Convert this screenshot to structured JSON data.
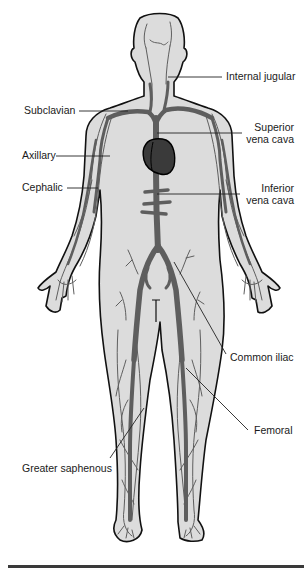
{
  "figure": {
    "colors": {
      "skin_fill": "#dcdcdc",
      "outline": "#111111",
      "vein": "#5e5e5e",
      "heart": "#3a3a3a",
      "leader_line": "#222222",
      "background": "#ffffff"
    }
  },
  "labels": {
    "internal_jugular": "Internal jugular",
    "subclavian": "Subclavian",
    "superior_vena_cava_line1": "Superior",
    "superior_vena_cava_line2": "vena cava",
    "axillary": "Axillary",
    "cephalic": "Cephalic",
    "inferior_vena_cava_line1": "Inferior",
    "inferior_vena_cava_line2": "vena cava",
    "common_iliac": "Common iliac",
    "femoral": "Femoral",
    "greater_saphenous": "Greater saphenous"
  }
}
